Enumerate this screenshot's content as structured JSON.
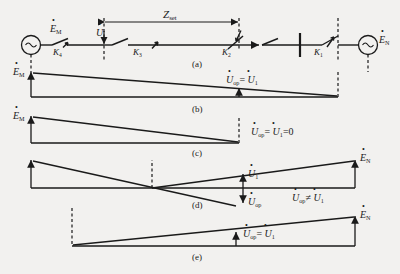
{
  "figure": {
    "type": "power-system-protection-diagram",
    "panels": [
      {
        "id": "a",
        "letter": "(a)",
        "caption": "single-line diagram"
      },
      {
        "id": "b",
        "letter": "(b)",
        "caption": "voltage profile, Uop equals U1"
      },
      {
        "id": "c",
        "letter": "(c)",
        "caption": "voltage profile, Uop equals U1 equals zero"
      },
      {
        "id": "d",
        "letter": "(d)",
        "caption": "voltage profile, Uop not equal U1"
      },
      {
        "id": "e",
        "letter": "(e)",
        "caption": "voltage profile, Uop equals U1"
      }
    ]
  },
  "circuit": {
    "source_left_label": "E",
    "source_left_sub": "M",
    "source_right_label": "E",
    "source_right_sub": "N",
    "source_symbol": "~",
    "measure_label": "U",
    "zset_label": "Z",
    "zset_sub": "set",
    "switches": [
      {
        "name": "K",
        "sub": "4"
      },
      {
        "name": "K",
        "sub": "3"
      },
      {
        "name": "K",
        "sub": "2"
      },
      {
        "name": "K",
        "sub": "1"
      }
    ]
  },
  "labels": {
    "E_M": "E",
    "E_M_sub": "M",
    "E_N": "E",
    "E_N_sub": "N",
    "U_op": "U",
    "U_op_sub": "op",
    "U_1": "U",
    "U_1_sub": "1",
    "eq": "=",
    "neq": "≠",
    "zero": "0"
  },
  "panel_b": {
    "relation_left": "U",
    "relation_left_sub": "op",
    "op": "=",
    "relation_right": "U",
    "relation_right_sub": "1"
  },
  "panel_c": {
    "relation_left": "U",
    "relation_left_sub": "op",
    "op": "=",
    "relation_right": "U",
    "relation_right_sub": "1",
    "tail": "=0"
  },
  "panel_d": {
    "u1": "U",
    "u1_sub": "1",
    "uop": "U",
    "uop_sub": "op",
    "relation_left": "U",
    "relation_left_sub": "op",
    "op": "≠",
    "relation_right": "U",
    "relation_right_sub": "1"
  },
  "panel_e": {
    "relation_left": "U",
    "relation_left_sub": "op",
    "op": "=",
    "relation_right": "U",
    "relation_right_sub": "1"
  },
  "colors": {
    "ink": "#1a1a1a",
    "bg": "#f2f1ef"
  }
}
